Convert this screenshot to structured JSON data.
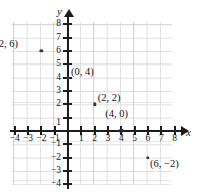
{
  "figure": {
    "type": "coordinate-plane",
    "axis_labels": {
      "x": "x",
      "y": "y"
    },
    "background_color": "#ffffff",
    "grid_color": "#d9d9d9",
    "axis_color": "#1c1c1c",
    "point_color": "#3a3a3a"
  },
  "chart_data": {
    "type": "scatter",
    "title": "",
    "xlabel": "x",
    "ylabel": "y",
    "grid": true,
    "legend": "none",
    "xlim": [
      -4,
      8
    ],
    "ylim": [
      -4,
      8
    ],
    "xticks": [
      -4,
      -3,
      -2,
      -1,
      1,
      2,
      3,
      4,
      5,
      6,
      7,
      8
    ],
    "yticks": [
      -4,
      -3,
      -2,
      -1,
      1,
      2,
      3,
      4,
      5,
      6,
      7,
      8
    ],
    "xtick_labels": [
      "-4",
      "-3",
      "-2",
      "-1",
      "1",
      "2",
      "3",
      "4",
      "5",
      "6",
      "7",
      "8"
    ],
    "ytick_labels": [
      "-4",
      "-3",
      "-2",
      "-1",
      "1",
      "2",
      "3",
      "4",
      "5",
      "6",
      "7",
      "8"
    ],
    "points": [
      {
        "x": -2,
        "y": 6,
        "label": "(−2, 6)",
        "label_position": "left"
      },
      {
        "x": 0,
        "y": 4,
        "label": "(0, 4)",
        "label_position": "right"
      },
      {
        "x": 2,
        "y": 2,
        "label": "(2, 2)",
        "label_position": "right"
      },
      {
        "x": 4,
        "y": 0,
        "label": "(4, 0)",
        "label_position": "above"
      },
      {
        "x": 6,
        "y": -2,
        "label": "(6, −2)",
        "label_position": "below-right"
      }
    ]
  },
  "ticks": {
    "x": [
      {
        "value": -4,
        "label": "-4"
      },
      {
        "value": -3,
        "label": "-3"
      },
      {
        "value": -2,
        "label": "-2"
      },
      {
        "value": -1,
        "label": "-1"
      },
      {
        "value": 1,
        "label": "1"
      },
      {
        "value": 2,
        "label": "2"
      },
      {
        "value": 3,
        "label": "3"
      },
      {
        "value": 4,
        "label": "4"
      },
      {
        "value": 5,
        "label": "5"
      },
      {
        "value": 6,
        "label": "6"
      },
      {
        "value": 7,
        "label": "7"
      },
      {
        "value": 8,
        "label": "8"
      }
    ],
    "y": [
      {
        "value": 8,
        "label": "8"
      },
      {
        "value": 7,
        "label": "7"
      },
      {
        "value": 6,
        "label": "6"
      },
      {
        "value": 5,
        "label": "5"
      },
      {
        "value": 4,
        "label": "4"
      },
      {
        "value": 3,
        "label": "3"
      },
      {
        "value": 2,
        "label": "2"
      },
      {
        "value": 1,
        "label": "1"
      },
      {
        "value": -1,
        "label": "-1"
      },
      {
        "value": -2,
        "label": "-2"
      },
      {
        "value": -3,
        "label": "-3"
      },
      {
        "value": -4,
        "label": "-4"
      }
    ]
  },
  "point_labels": {
    "p1": "(−2, 6)",
    "p2": "(0, 4)",
    "p3": "(2, 2)",
    "p4": "(4, 0)",
    "p5": "(6, −2)"
  }
}
